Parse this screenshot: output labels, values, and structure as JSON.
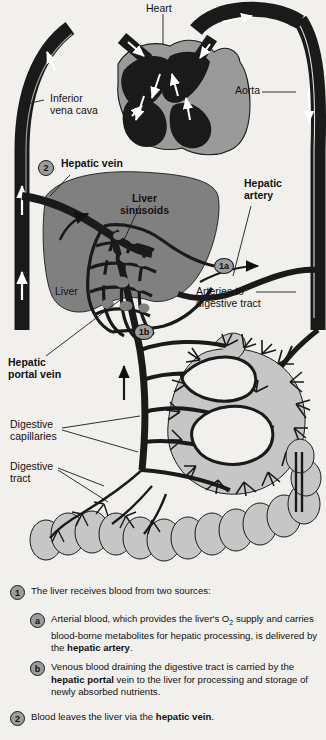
{
  "figure": {
    "colors": {
      "background": "#f2f0ec",
      "vessel_dark": "#1a1a1a",
      "liver_gray": "#808080",
      "organ_light_gray": "#c6c6c6",
      "heart_muscle_gray": "#9a9a9a",
      "badge_gray": "#9c9c9c",
      "white": "#ffffff"
    },
    "labels": [
      {
        "id": "heart",
        "text": "Heart",
        "bold": false
      },
      {
        "id": "inferior-vena-cava",
        "text": "Inferior\nvena cava",
        "bold": false
      },
      {
        "id": "aorta",
        "text": "Aorta",
        "bold": false
      },
      {
        "id": "hepatic-vein",
        "text": "Hepatic vein",
        "bold": true
      },
      {
        "id": "liver-sinusoids",
        "text": "Liver\nsinusoids",
        "bold": true
      },
      {
        "id": "hepatic-artery",
        "text": "Hepatic\nartery",
        "bold": true
      },
      {
        "id": "liver",
        "text": "Liver",
        "bold": false
      },
      {
        "id": "arteries-to-digestive",
        "text": "Arteries to\ndigestive tract",
        "bold": false
      },
      {
        "id": "hepatic-portal-vein",
        "text": "Hepatic\nportal vein",
        "bold": true
      },
      {
        "id": "digestive-capillaries",
        "text": "Digestive\ncapillaries",
        "bold": false
      },
      {
        "id": "digestive-tract",
        "text": "Digestive\ntract",
        "bold": false
      }
    ],
    "markers": [
      {
        "id": "marker-2",
        "text": "2"
      },
      {
        "id": "marker-1a",
        "text": "1a"
      },
      {
        "id": "marker-1b",
        "text": "1b"
      }
    ]
  },
  "caption": {
    "items": [
      {
        "badge": "1",
        "html": "The liver receives blood from two sources:"
      },
      {
        "badge": "a",
        "html": "Arterial blood, which provides the liver's O<sub>2</sub> supply and carries blood-borne metabolites for hepatic processing, is delivered by the <b>hepatic artery</b>."
      },
      {
        "badge": "b",
        "html": "Venous blood draining the digestive tract is carried by the <b>hepatic portal</b> vein to the liver for processing  and storage of newly absorbed nutrients."
      },
      {
        "badge": "2",
        "html": "Blood leaves the liver via the <b>hepatic vein</b>."
      }
    ]
  }
}
